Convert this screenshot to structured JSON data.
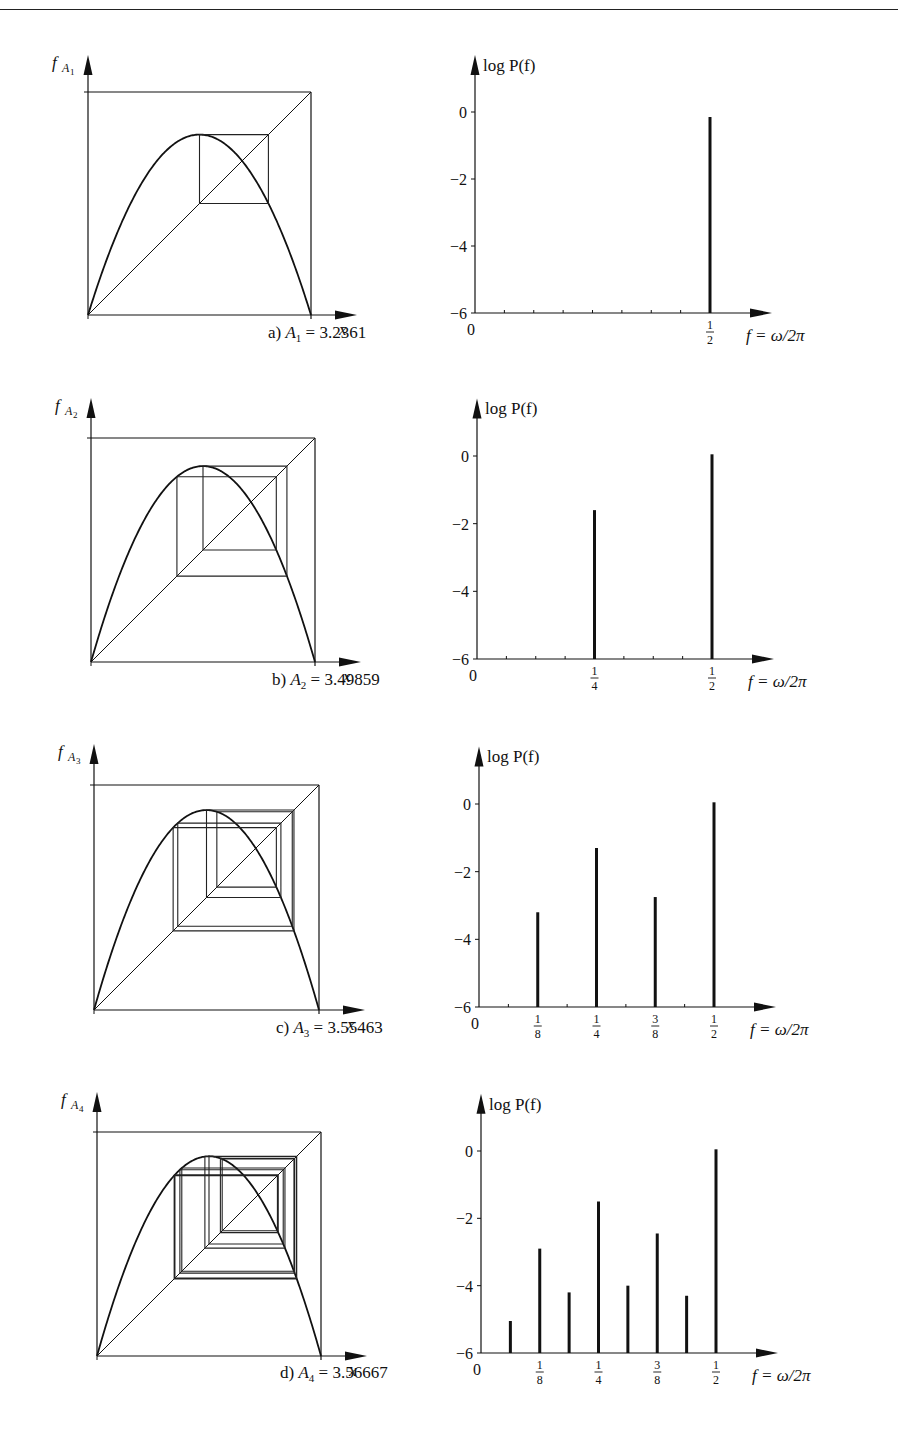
{
  "figure": {
    "panels": [
      {
        "id": "a",
        "caption_prefix": "a)",
        "param_symbol": "A",
        "param_sub": "1",
        "param_equals": "= 3.2361",
        "map_ylabel": "f",
        "map_ylabel_sub": "A",
        "map_ylabel_subsub": "1",
        "map_xlabel": "x"
      },
      {
        "id": "b",
        "caption_prefix": "b)",
        "param_symbol": "A",
        "param_sub": "2",
        "param_equals": "= 3.49859",
        "map_ylabel": "f",
        "map_ylabel_sub": "A",
        "map_ylabel_subsub": "2",
        "map_xlabel": "x"
      },
      {
        "id": "c",
        "caption_prefix": "c)",
        "param_symbol": "A",
        "param_sub": "3",
        "param_equals": "= 3.55463",
        "map_ylabel": "f",
        "map_ylabel_sub": "A",
        "map_ylabel_subsub": "3",
        "map_xlabel": "x"
      },
      {
        "id": "d",
        "caption_prefix": "d)",
        "param_symbol": "A",
        "param_sub": "4",
        "param_equals": "= 3.56667",
        "map_ylabel": "f",
        "map_ylabel_sub": "A",
        "map_ylabel_subsub": "4",
        "map_xlabel": "x"
      }
    ],
    "spectrum_ylabel": "log P(f)",
    "spectrum_xlabel": "f = ω/2π",
    "spectrum_yticks": [
      "0",
      "−2",
      "−4",
      "−6"
    ],
    "spectrum_x_origin": "0"
  },
  "chart_data": [
    {
      "type": "bar",
      "title": "a) A1 = 3.2361",
      "xlabel": "f = ω/2π",
      "ylabel": "log P(f)",
      "ylim": [
        -6,
        1
      ],
      "xlim": [
        0,
        0.58
      ],
      "yticks": [
        0,
        -2,
        -4,
        -6
      ],
      "x": [
        0.5
      ],
      "tick_labels": [
        "1/2"
      ],
      "values": [
        -0.15
      ],
      "grid": false
    },
    {
      "type": "bar",
      "title": "b) A2 = 3.49859",
      "xlabel": "f = ω/2π",
      "ylabel": "log P(f)",
      "ylim": [
        -6,
        1
      ],
      "xlim": [
        0,
        0.58
      ],
      "yticks": [
        0,
        -2,
        -4,
        -6
      ],
      "x": [
        0.25,
        0.5
      ],
      "tick_labels": [
        "1/4",
        "1/2"
      ],
      "values": [
        -1.6,
        0.05
      ],
      "grid": false
    },
    {
      "type": "bar",
      "title": "c) A3 = 3.55463",
      "xlabel": "f = ω/2π",
      "ylabel": "log P(f)",
      "ylim": [
        -6,
        1
      ],
      "xlim": [
        0,
        0.58
      ],
      "yticks": [
        0,
        -2,
        -4,
        -6
      ],
      "x": [
        0.125,
        0.25,
        0.375,
        0.5
      ],
      "tick_labels": [
        "1/8",
        "1/4",
        "3/8",
        "1/2"
      ],
      "values": [
        -3.2,
        -1.3,
        -2.75,
        0.05
      ],
      "grid": false
    },
    {
      "type": "bar",
      "title": "d) A4 = 3.56667",
      "xlabel": "f = ω/2π",
      "ylabel": "log P(f)",
      "ylim": [
        -6,
        1
      ],
      "xlim": [
        0,
        0.58
      ],
      "yticks": [
        0,
        -2,
        -4,
        -6
      ],
      "x": [
        0.0625,
        0.125,
        0.1875,
        0.25,
        0.3125,
        0.375,
        0.4375,
        0.5
      ],
      "tick_labels": [
        "",
        "1/8",
        "",
        "1/4",
        "",
        "3/8",
        "",
        "1/2"
      ],
      "values": [
        -5.05,
        -2.9,
        -4.2,
        -1.5,
        -4.0,
        -2.45,
        -4.3,
        0.05
      ],
      "grid": false
    }
  ],
  "cobweb_data": [
    {
      "panel": "a",
      "A": 3.2361,
      "period": 2
    },
    {
      "panel": "b",
      "A": 3.49859,
      "period": 4
    },
    {
      "panel": "c",
      "A": 3.55463,
      "period": 8
    },
    {
      "panel": "d",
      "A": 3.56667,
      "period": 16
    }
  ]
}
